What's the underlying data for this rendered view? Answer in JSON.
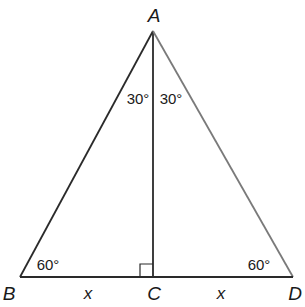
{
  "diagram": {
    "type": "geometry",
    "vertices": {
      "A": {
        "label": "A",
        "x": 153,
        "y": 31
      },
      "B": {
        "label": "B",
        "x": 20,
        "y": 277
      },
      "C": {
        "label": "C",
        "x": 153,
        "y": 277
      },
      "D": {
        "label": "D",
        "x": 293,
        "y": 277
      }
    },
    "segments": [
      {
        "from": "A",
        "to": "B",
        "color": "#2a2a2a"
      },
      {
        "from": "A",
        "to": "C",
        "color": "#2a2a2a"
      },
      {
        "from": "A",
        "to": "D",
        "color": "#7a7a7a"
      },
      {
        "from": "B",
        "to": "C",
        "color": "#2a2a2a"
      },
      {
        "from": "C",
        "to": "D",
        "color": "#2a2a2a"
      }
    ],
    "angle_labels": {
      "BAC": "30°",
      "CAD": "30°",
      "ABC": "60°",
      "ADC": "60°"
    },
    "side_labels": {
      "BC": "x",
      "CD": "x"
    },
    "right_angle": {
      "at": "C",
      "size": 13
    }
  }
}
